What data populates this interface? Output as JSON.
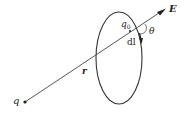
{
  "diagram": {
    "labels": {
      "charge": "q",
      "field": "E",
      "test_charge": "q",
      "test_charge_sub": "0",
      "line_element": "dl",
      "angle": "θ",
      "radius": "r"
    },
    "colors": {
      "stroke": "#333333",
      "background": "#ffffff"
    }
  }
}
